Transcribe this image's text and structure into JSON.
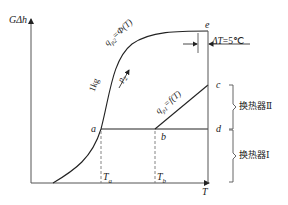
{
  "diagram": {
    "axes": {
      "y_label": "GΔh",
      "x_label": "T"
    },
    "points": {
      "a": "a",
      "b": "b",
      "c": "c",
      "d": "d",
      "e": "e"
    },
    "ticks": {
      "Ta": "T",
      "Ta_sub": "a",
      "Tb": "T",
      "Tb_sub": "b"
    },
    "curves": {
      "upper_label": "q",
      "upper_sub": "p2",
      "upper_rest": "=Φ(T)",
      "lower_label": "q",
      "lower_sub": "p1",
      "lower_rest": "=f(T)",
      "mass_label": "1kg",
      "arrow_label": "p",
      "arrow_sub": "2"
    },
    "delta_t": "ΔT=5℃",
    "heat_exchangers": {
      "upper": "换热器Ⅱ",
      "lower": "换热器Ⅰ"
    },
    "colors": {
      "line": "#222222",
      "axis": "#555555",
      "dashed": "#777777"
    }
  }
}
